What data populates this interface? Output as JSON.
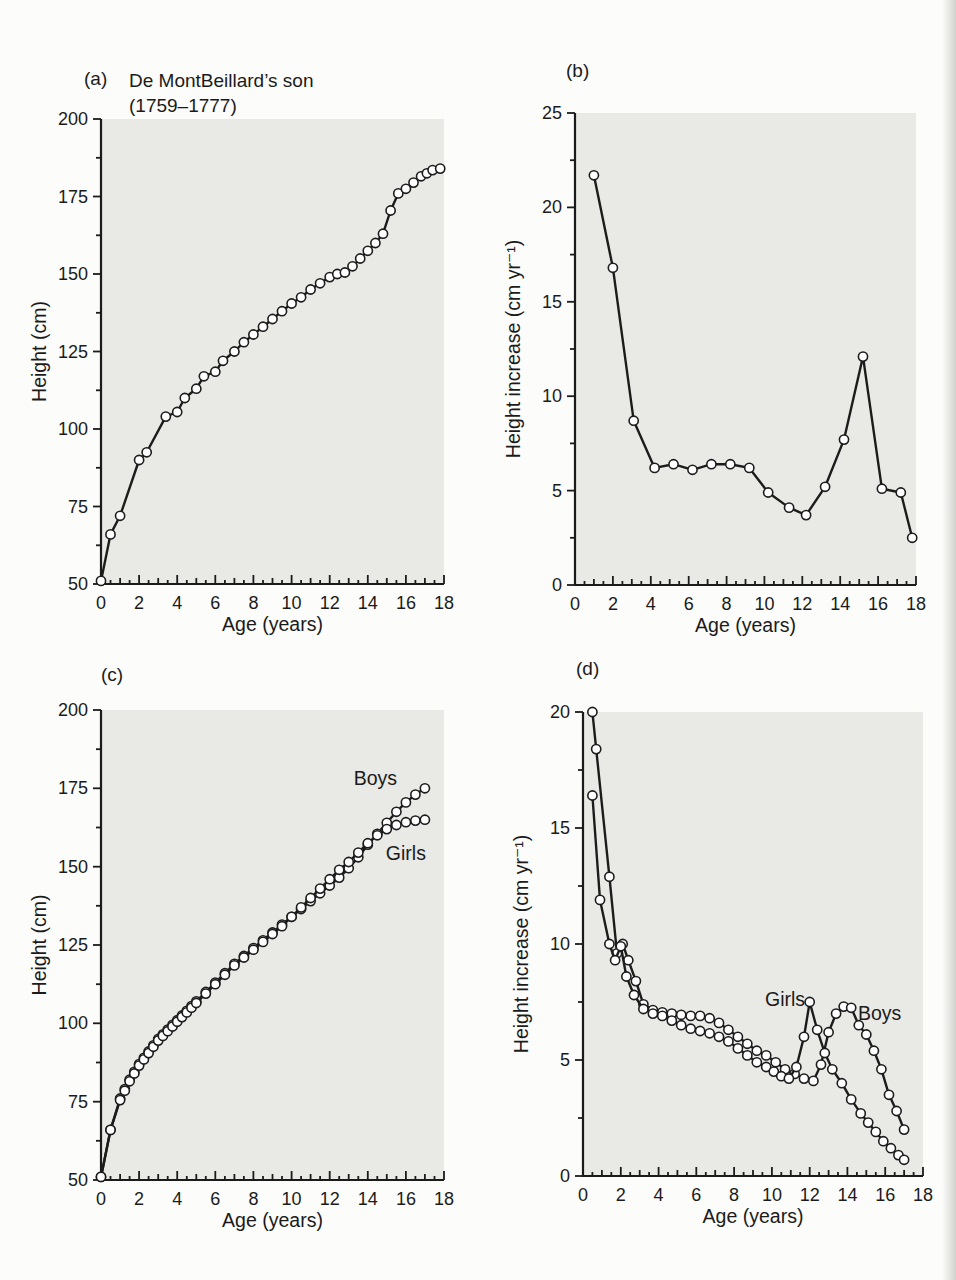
{
  "figure": {
    "background": "#fcfcfa",
    "plot_background": "#e9e9e6",
    "line_color": "#1c1c1c",
    "marker_fill": "#ffffff",
    "axis_color": "#1b1b1b"
  },
  "panels_meta": {
    "a": {
      "tag": "(a)",
      "title_line1": "De MontBeillard’s son",
      "title_line2": "(1759–1777)"
    },
    "b": {
      "tag": "(b)"
    },
    "c": {
      "tag": "(c)"
    },
    "d": {
      "tag": "(d)"
    }
  },
  "chart_data": [
    {
      "id": "a",
      "type": "line",
      "title": "De MontBeillard’s son (1759–1777)",
      "xlabel": "Age (years)",
      "ylabel": "Height (cm)",
      "xlim": [
        0,
        18
      ],
      "ylim": [
        50,
        200
      ],
      "xticks": {
        "major": 2,
        "mid": 1,
        "sub": 0.5
      },
      "yticks": {
        "major": 25,
        "minor": 12.5
      },
      "grid": false,
      "legend": "none",
      "layout": {
        "plot": {
          "left": 101,
          "top": 119,
          "right": 444,
          "bottom": 584
        }
      },
      "series": [
        {
          "name": "height",
          "x": [
            0,
            0.5,
            1,
            2,
            2.4,
            3.4,
            4,
            4.4,
            5,
            5.4,
            6,
            6.4,
            7,
            7.5,
            8,
            8.5,
            9,
            9.5,
            10,
            10.5,
            11,
            11.5,
            12,
            12.4,
            12.8,
            13.2,
            13.6,
            14,
            14.4,
            14.8,
            15.2,
            15.6,
            16,
            16.4,
            16.8,
            17.1,
            17.4,
            17.8
          ],
          "y": [
            51,
            66,
            72,
            90,
            92.5,
            104,
            105.5,
            110,
            113,
            117,
            118.5,
            122,
            125,
            128,
            130.5,
            133,
            135.5,
            138,
            140.5,
            142.5,
            145,
            147,
            149,
            150,
            150.5,
            152.5,
            155,
            157.5,
            160,
            163,
            170.5,
            176,
            177.5,
            179.5,
            181.5,
            182.5,
            183.5,
            184
          ]
        }
      ],
      "annotations": []
    },
    {
      "id": "b",
      "type": "line",
      "title": "",
      "xlabel": "Age (years)",
      "ylabel": "Height increase (cm yr⁻¹)",
      "xlim": [
        0,
        18
      ],
      "ylim": [
        0,
        25
      ],
      "xticks": {
        "major": 2,
        "mid": 1,
        "sub": 0.5
      },
      "yticks": {
        "major": 5,
        "minor": 2.5
      },
      "grid": false,
      "legend": "none",
      "layout": {
        "plot": {
          "left": 97,
          "top": 113,
          "right": 438,
          "bottom": 585
        }
      },
      "series": [
        {
          "name": "height-increase",
          "x": [
            1,
            2,
            3.1,
            4.2,
            5.2,
            6.2,
            7.2,
            8.2,
            9.2,
            10.2,
            11.3,
            12.2,
            13.2,
            14.2,
            15.2,
            16.2,
            17.2,
            17.8
          ],
          "y": [
            21.7,
            16.8,
            8.7,
            6.2,
            6.4,
            6.1,
            6.4,
            6.4,
            6.2,
            4.9,
            4.1,
            3.7,
            5.2,
            7.7,
            12.1,
            5.1,
            4.9,
            2.5
          ]
        }
      ],
      "annotations": []
    },
    {
      "id": "c",
      "type": "line",
      "title": "",
      "xlabel": "Age (years)",
      "ylabel": "Height (cm)",
      "xlim": [
        0,
        18
      ],
      "ylim": [
        50,
        200
      ],
      "xticks": {
        "major": 2,
        "mid": 1,
        "sub": 0.5
      },
      "yticks": {
        "major": 25,
        "minor": 12.5
      },
      "grid": false,
      "legend": "inline-labels",
      "layout": {
        "plot": {
          "left": 101,
          "top": 70,
          "right": 444,
          "bottom": 540
        }
      },
      "series": [
        {
          "name": "boys",
          "x": [
            0,
            0.5,
            1,
            1.25,
            1.5,
            1.75,
            2,
            2.25,
            2.5,
            2.75,
            3,
            3.25,
            3.5,
            3.75,
            4,
            4.25,
            4.5,
            4.75,
            5,
            5.5,
            6,
            6.5,
            7,
            7.5,
            8,
            8.5,
            9,
            9.5,
            10,
            10.5,
            11,
            11.5,
            12,
            12.5,
            13,
            13.5,
            14,
            14.5,
            15,
            15.5,
            16,
            16.5,
            17
          ],
          "y": [
            51,
            66,
            76,
            79,
            82,
            84.5,
            87,
            89,
            91,
            93,
            95,
            96.5,
            98,
            99.5,
            101,
            102.5,
            104,
            105.5,
            107,
            110,
            113,
            116,
            119,
            121.5,
            124,
            126.5,
            129,
            131.5,
            134,
            136.5,
            139,
            141.5,
            144,
            146.5,
            149.5,
            153,
            157,
            160.5,
            164,
            167.5,
            170.5,
            173,
            175
          ]
        },
        {
          "name": "girls",
          "x": [
            0,
            0.5,
            1,
            1.25,
            1.5,
            1.75,
            2,
            2.25,
            2.5,
            2.75,
            3,
            3.25,
            3.5,
            3.75,
            4,
            4.25,
            4.5,
            4.75,
            5,
            5.5,
            6,
            6.5,
            7,
            7.5,
            8,
            8.5,
            9,
            9.5,
            10,
            10.5,
            11,
            11.5,
            12,
            12.5,
            13,
            13.5,
            14,
            14.5,
            15,
            15.5,
            16,
            16.5,
            17
          ],
          "y": [
            51,
            66,
            75.5,
            78.5,
            81.5,
            84,
            86.5,
            88.5,
            90.5,
            92.5,
            94.5,
            96,
            97.5,
            99,
            100.5,
            102,
            103.5,
            105,
            106.5,
            109.5,
            112.5,
            115.5,
            118.5,
            121,
            123.5,
            126,
            128.5,
            131,
            134,
            137,
            140,
            143,
            146,
            149,
            151.5,
            154.5,
            157.5,
            160,
            162,
            163.3,
            164.2,
            164.7,
            165
          ]
        }
      ],
      "annotations": [
        {
          "name": "boys-label",
          "text": "Boys",
          "x": 14.4,
          "y": 178
        },
        {
          "name": "girls-label",
          "text": "Girls",
          "x": 16.0,
          "y": 154
        }
      ]
    },
    {
      "id": "d",
      "type": "line",
      "title": "",
      "xlabel": "Age (years)",
      "ylabel": "Height increase (cm yr⁻¹)",
      "xlim": [
        0,
        18
      ],
      "ylim": [
        0,
        20
      ],
      "xticks": {
        "major": 2,
        "mid": 1,
        "sub": 0.5
      },
      "yticks": {
        "major": 5,
        "minor": 2.5
      },
      "grid": false,
      "legend": "inline-labels",
      "layout": {
        "plot": {
          "left": 105,
          "top": 72,
          "right": 445,
          "bottom": 536
        }
      },
      "series": [
        {
          "name": "boys",
          "x": [
            0.5,
            0.7,
            1.4,
            1.8,
            2.1,
            2.4,
            2.8,
            3.2,
            3.7,
            4.2,
            4.7,
            5.2,
            5.7,
            6.2,
            6.7,
            7.2,
            7.7,
            8.2,
            8.7,
            9.2,
            9.7,
            10.2,
            10.7,
            11.2,
            11.7,
            12.2,
            12.6,
            13,
            13.4,
            13.8,
            14.2,
            14.6,
            15,
            15.4,
            15.8,
            16.2,
            16.6,
            17
          ],
          "y": [
            20,
            18.4,
            12.9,
            9.6,
            10,
            9.3,
            8.4,
            7.4,
            7.15,
            7.05,
            7,
            6.95,
            6.9,
            6.9,
            6.8,
            6.6,
            6.3,
            6,
            5.7,
            5.4,
            5.2,
            4.9,
            4.6,
            4.4,
            4.2,
            4.1,
            4.8,
            6.2,
            7,
            7.3,
            7.25,
            6.5,
            6.1,
            5.4,
            4.6,
            3.5,
            2.8,
            2
          ]
        },
        {
          "name": "girls",
          "x": [
            0.5,
            0.9,
            1.4,
            1.7,
            2,
            2.3,
            2.7,
            3.2,
            3.7,
            4.2,
            4.7,
            5.2,
            5.7,
            6.2,
            6.7,
            7.2,
            7.7,
            8.2,
            8.7,
            9.2,
            9.7,
            10.1,
            10.5,
            10.9,
            11.3,
            11.7,
            12,
            12.4,
            12.8,
            13.2,
            13.7,
            14.2,
            14.7,
            15.1,
            15.5,
            15.9,
            16.3,
            16.7,
            17
          ],
          "y": [
            16.4,
            11.9,
            10,
            9.3,
            9.9,
            8.6,
            7.8,
            7.2,
            7,
            6.9,
            6.7,
            6.5,
            6.35,
            6.25,
            6.15,
            6,
            5.8,
            5.5,
            5.2,
            4.9,
            4.7,
            4.5,
            4.3,
            4.2,
            4.7,
            6,
            7.5,
            6.3,
            5.3,
            4.6,
            4,
            3.3,
            2.7,
            2.3,
            1.9,
            1.5,
            1.2,
            0.9,
            0.7
          ]
        }
      ],
      "annotations": [
        {
          "name": "girls-label",
          "text": "Girls",
          "x": 10.7,
          "y": 7.6
        },
        {
          "name": "boys-label",
          "text": "Boys",
          "x": 15.7,
          "y": 7.0
        }
      ]
    }
  ]
}
